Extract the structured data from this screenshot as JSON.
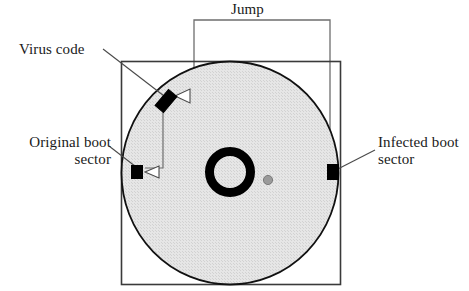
{
  "figure": {
    "background_color": "#ffffff",
    "labels": {
      "jump": "Jump",
      "virus_code": "Virus code",
      "original_boot_line1": "Original boot",
      "original_boot_line2": "sector",
      "infected_boot_line1": "Infected boot",
      "infected_boot_line2": "sector"
    },
    "colors": {
      "outline": "#1a1a1a",
      "disk_fill": "#e3e3e3",
      "marker_fill": "#000000",
      "hub_ring": "#000000",
      "hub_center": "#ffffff",
      "index_hole": "#9a9a9a",
      "leader_line": "#4a4a4a",
      "jump_line": "#6e6e6e"
    },
    "shapes": {
      "diskette_shell": {
        "x": 121,
        "y": 61,
        "width": 219,
        "height": 224
      },
      "disk_platter": {
        "cx": 230,
        "cy": 173,
        "rx": 109,
        "ry": 112
      },
      "hub_ring": {
        "cx": 230,
        "cy": 172,
        "outer_r": 25,
        "inner_r": 16
      },
      "index_hole": {
        "cx": 268,
        "cy": 180,
        "r": 5
      },
      "virus_code_marker": {
        "cx": 166,
        "cy": 101,
        "width": 10,
        "height": 21,
        "rotation_deg": 40
      },
      "original_boot_marker": {
        "cx": 137,
        "cy": 172,
        "width": 11,
        "height": 13
      },
      "infected_boot_marker": {
        "cx": 333,
        "cy": 172,
        "width": 11,
        "height": 15
      }
    }
  }
}
